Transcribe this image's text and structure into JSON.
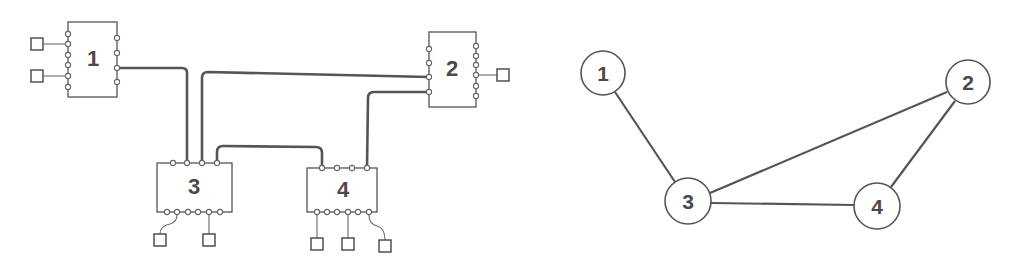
{
  "figure": {
    "left_panel": {
      "title": "Physical network wiring",
      "blocks": [
        {
          "id": "1",
          "label": "1"
        },
        {
          "id": "2",
          "label": "2"
        },
        {
          "id": "3",
          "label": "3"
        },
        {
          "id": "4",
          "label": "4"
        }
      ],
      "connections": [
        {
          "from": "1",
          "to": "3"
        },
        {
          "from": "2",
          "to": "3"
        },
        {
          "from": "2",
          "to": "4"
        },
        {
          "from": "3",
          "to": "4"
        }
      ],
      "terminals": {
        "1": 2,
        "2": 1,
        "3": 2,
        "4": 3
      }
    },
    "right_panel": {
      "title": "Graph representation",
      "nodes": [
        {
          "id": "1",
          "label": "1"
        },
        {
          "id": "2",
          "label": "2"
        },
        {
          "id": "3",
          "label": "3"
        },
        {
          "id": "4",
          "label": "4"
        }
      ],
      "edges": [
        {
          "from": "1",
          "to": "3"
        },
        {
          "from": "3",
          "to": "2"
        },
        {
          "from": "3",
          "to": "4"
        },
        {
          "from": "4",
          "to": "2"
        }
      ]
    }
  },
  "colors": {
    "stroke": "#555555",
    "text": "#4a4a4a",
    "background": "#ffffff"
  }
}
